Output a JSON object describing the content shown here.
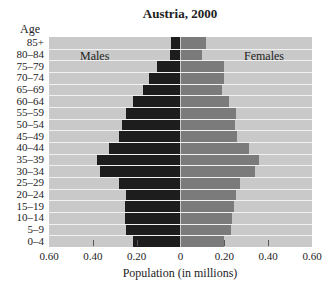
{
  "chart_data": {
    "type": "bar",
    "subtype": "population-pyramid",
    "title": "Austria, 2000",
    "xlabel": "Population (in millions)",
    "ylabel": "Age",
    "xlim": [
      -0.6,
      0.6
    ],
    "x_ticks": [
      "0.60",
      "0.40",
      "0.20",
      "0",
      "0.20",
      "0.40",
      "0.60"
    ],
    "legend": [
      "Males",
      "Females"
    ],
    "grid": false,
    "categories": [
      "85+",
      "80–84",
      "75–79",
      "70–74",
      "65–69",
      "60–64",
      "55–59",
      "50–54",
      "45–49",
      "40–44",
      "35–39",
      "30–34",
      "25–29",
      "20–24",
      "15–19",
      "10–14",
      "5–9",
      "0–4"
    ],
    "series": [
      {
        "name": "Males",
        "color": "#1d1d1d",
        "values": [
          0.045,
          0.048,
          0.106,
          0.145,
          0.17,
          0.218,
          0.25,
          0.268,
          0.28,
          0.327,
          0.379,
          0.367,
          0.28,
          0.248,
          0.254,
          0.254,
          0.25,
          0.215
        ]
      },
      {
        "name": "Females",
        "color": "#7b7b7b",
        "values": [
          0.115,
          0.1,
          0.197,
          0.197,
          0.19,
          0.22,
          0.255,
          0.248,
          0.26,
          0.312,
          0.36,
          0.342,
          0.272,
          0.251,
          0.242,
          0.233,
          0.23,
          0.2
        ]
      }
    ]
  },
  "labels": {
    "title": "Austria, 2000",
    "age_header": "Age",
    "males": "Males",
    "females": "Females",
    "xlabel": "Population (in millions)"
  },
  "colors": {
    "background": "#c9c9c9",
    "males": "#1d1d1d",
    "females": "#7b7b7b"
  }
}
